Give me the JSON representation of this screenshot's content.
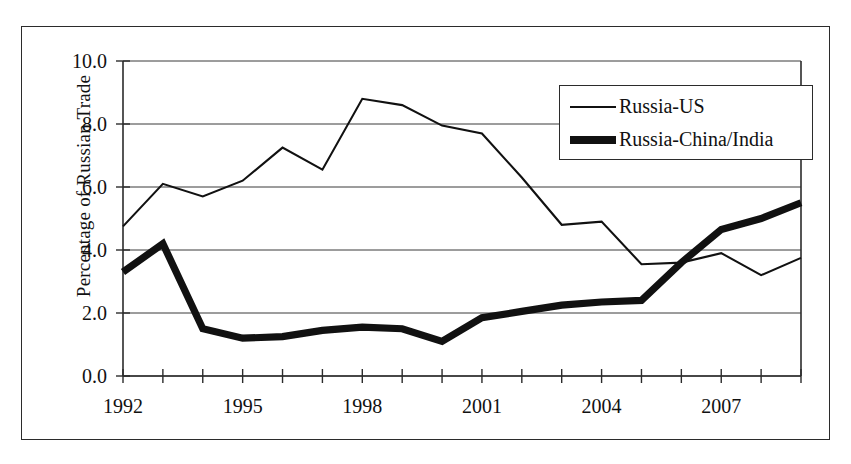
{
  "chart_data": {
    "type": "line",
    "title": "",
    "xlabel": "",
    "ylabel": "Percentage of Russian Trade",
    "xlim": [
      1992,
      2009
    ],
    "ylim": [
      0.0,
      10.0
    ],
    "ytick_labels": [
      "10.0",
      "8.0",
      "6.0",
      "4.0",
      "2.0",
      "0.0"
    ],
    "ytick_values": [
      10.0,
      8.0,
      6.0,
      4.0,
      2.0,
      0.0
    ],
    "xtick_labels": [
      "1992",
      "1995",
      "1998",
      "2001",
      "2004",
      "2007"
    ],
    "xtick_values": [
      1992,
      1995,
      1998,
      2001,
      2004,
      2007
    ],
    "x": [
      1992,
      1993,
      1994,
      1995,
      1996,
      1997,
      1998,
      1999,
      2000,
      2001,
      2002,
      2003,
      2004,
      2005,
      2006,
      2007,
      2008,
      2009
    ],
    "grid": "horizontal",
    "legend_position": "top-right",
    "series": [
      {
        "name": "Russia-US",
        "style": "thin",
        "values": [
          4.75,
          6.1,
          5.7,
          6.2,
          7.25,
          6.55,
          8.8,
          8.6,
          7.95,
          7.7,
          6.3,
          4.8,
          4.9,
          3.55,
          3.6,
          3.9,
          3.2,
          3.75
        ]
      },
      {
        "name": "Russia-China/India",
        "style": "thick",
        "values": [
          3.3,
          4.2,
          1.5,
          1.2,
          1.25,
          1.45,
          1.55,
          1.5,
          1.1,
          1.85,
          2.05,
          2.25,
          2.35,
          2.4,
          3.6,
          4.65,
          5.0,
          5.5
        ]
      }
    ]
  },
  "legend": {
    "items": [
      {
        "label": "Russia-US",
        "style": "thin"
      },
      {
        "label": "Russia-China/India",
        "style": "thick"
      }
    ]
  }
}
